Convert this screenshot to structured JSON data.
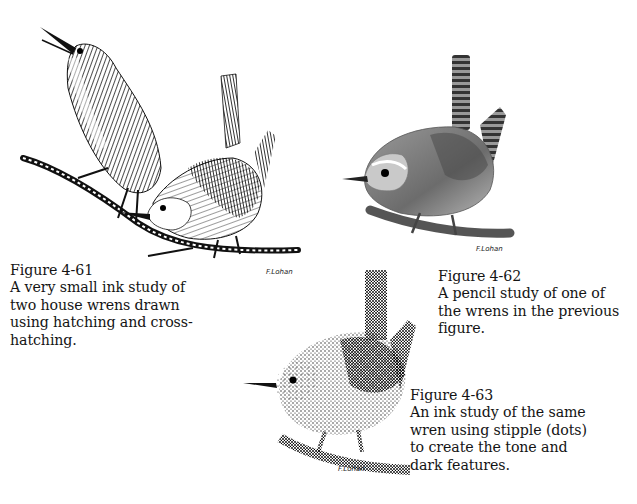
{
  "figures": [
    {
      "id": "4-61",
      "title": "Figure 4-61",
      "caption_lines": [
        "A very small ink study of",
        "two house wrens drawn",
        "using hatching and cross-",
        "hatching."
      ],
      "technique": "ink hatching and cross-hatching",
      "signature": "F.Lohan"
    },
    {
      "id": "4-62",
      "title": "Figure 4-62",
      "caption_lines": [
        "A pencil study of one of",
        "the wrens in the previous",
        "figure."
      ],
      "technique": "pencil",
      "signature": "F.Lohan"
    },
    {
      "id": "4-63",
      "title": "Figure 4-63",
      "caption_lines": [
        "An ink study of the same",
        "wren using stipple (dots)",
        "to create the tone and",
        "dark features."
      ],
      "technique": "ink stipple",
      "signature": "F.Lohan"
    }
  ],
  "colors": {
    "ink": "#111111",
    "pencil": "#6a6a6a",
    "paper": "#ffffff"
  }
}
